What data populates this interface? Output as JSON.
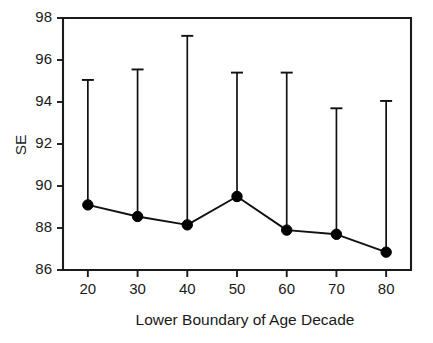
{
  "chart_data": {
    "type": "line",
    "title": "",
    "subtitle": "",
    "xlabel": "Lower Boundary of Age Decade",
    "ylabel": "SE",
    "x": [
      20,
      30,
      40,
      50,
      60,
      70,
      80
    ],
    "categories": [
      "20",
      "30",
      "40",
      "50",
      "60",
      "70",
      "80"
    ],
    "values": [
      89.1,
      88.55,
      88.15,
      89.5,
      87.9,
      87.7,
      86.85
    ],
    "series": [
      {
        "name": "SE",
        "values": [
          89.1,
          88.55,
          88.15,
          89.5,
          87.9,
          87.7,
          86.85
        ],
        "error_upper": [
          95.05,
          95.55,
          97.15,
          95.4,
          95.4,
          93.7,
          94.05
        ],
        "marker": "filled-circle",
        "color": "#000000"
      }
    ],
    "xlim": [
      15,
      85
    ],
    "ylim": [
      86,
      98
    ],
    "xticks": [
      20,
      30,
      40,
      50,
      60,
      70,
      80
    ],
    "yticks": [
      86,
      88,
      90,
      92,
      94,
      96,
      98
    ],
    "xtick_labels": [
      "20",
      "30",
      "40",
      "50",
      "60",
      "70",
      "80"
    ],
    "ytick_labels": [
      "86",
      "88",
      "90",
      "92",
      "94",
      "96",
      "98"
    ],
    "grid": false,
    "legend": null,
    "legend_position": "none",
    "error_bar_style": "upper-only-with-cap",
    "annotations": []
  },
  "figure": {
    "background_color": "#ffffff",
    "axis_color": "#1a1a1a",
    "series_color": "#000000"
  }
}
